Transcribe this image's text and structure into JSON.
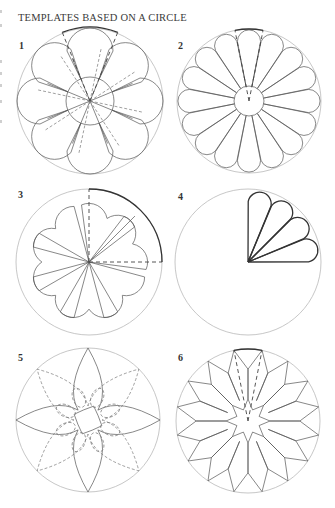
{
  "page": {
    "title": "TEMPLATES BASED ON A CIRCLE",
    "guide_color": "#b9b9b9",
    "ink_color": "#555555"
  },
  "figures": [
    {
      "label": "1",
      "label_pos": [
        19,
        48
      ],
      "center": [
        90,
        101
      ],
      "radius": 73,
      "type": "eight-petal-flower",
      "petals": 8,
      "inner_radius": 24
    },
    {
      "label": "2",
      "label_pos": [
        178,
        48
      ],
      "center": [
        249,
        101
      ],
      "radius": 72,
      "type": "sixteen-petal-flower",
      "petals": 16,
      "inner_radius": 15
    },
    {
      "label": "3",
      "label_pos": [
        18,
        197
      ],
      "center": [
        89,
        262
      ],
      "radius": 73,
      "type": "three-quarter-heart-flower",
      "petals": 6
    },
    {
      "label": "4",
      "label_pos": [
        178,
        199
      ],
      "center": [
        248,
        262
      ],
      "radius": 73,
      "type": "quarter-fan",
      "petals": 4
    },
    {
      "label": "5",
      "label_pos": [
        18,
        360
      ],
      "center": [
        88,
        420
      ],
      "radius": 72,
      "type": "pointed-star-flower",
      "petals": 4
    },
    {
      "label": "6",
      "label_pos": [
        178,
        360
      ],
      "center": [
        248,
        421
      ],
      "radius": 72,
      "type": "star-kites",
      "petals": 16
    }
  ]
}
